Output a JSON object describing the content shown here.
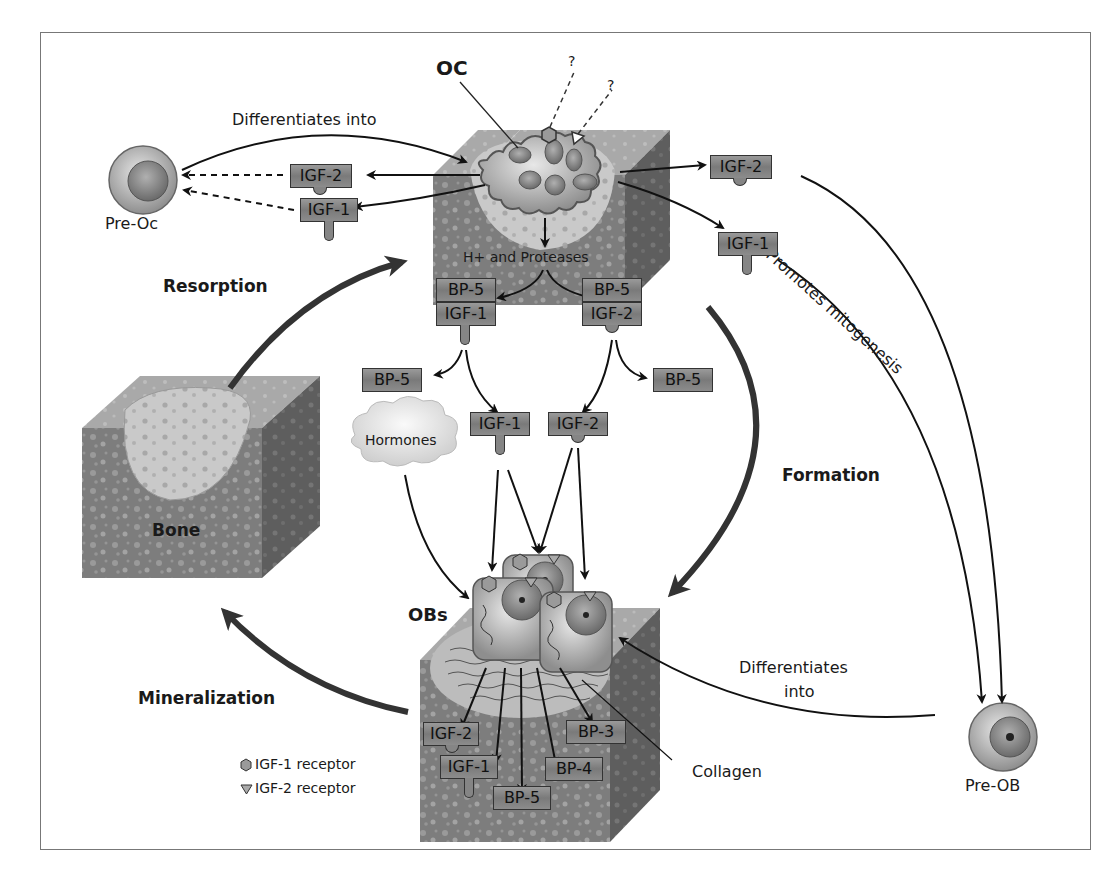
{
  "figure": {
    "title_labels": {
      "oc": "OC",
      "obs": "OBs",
      "bone": "Bone",
      "pre_oc": "Pre-Oc",
      "pre_ob": "Pre-OB",
      "hormones": "Hormones",
      "collagen": "Collagen",
      "h_proteases": "H+ and Proteases",
      "unknown_1": "?",
      "unknown_2": "?"
    },
    "processes": {
      "resorption": "Resorption",
      "formation": "Formation",
      "mineralization": "Mineralization",
      "differentiates_into_top": "Differentiates into",
      "differentiates_into_bottom_1": "Differentiates",
      "differentiates_into_bottom_2": "into",
      "promotes_mitogenesis": "Promotes mitogenesis"
    },
    "factors": {
      "oc_left_igf2": "IGF-2",
      "oc_left_igf1": "IGF-1",
      "oc_right_igf2": "IGF-2",
      "oc_right_igf1": "IGF-1",
      "matrix_bp5_left": "BP-5",
      "matrix_igf1_left": "IGF-1",
      "matrix_bp5_right": "BP-5",
      "matrix_igf2_right": "IGF-2",
      "released_bp5_left": "BP-5",
      "released_bp5_right": "BP-5",
      "free_igf1": "IGF-1",
      "free_igf2": "IGF-2",
      "ob_igf2": "IGF-2",
      "ob_igf1": "IGF-1",
      "ob_bp5": "BP-5",
      "ob_bp3": "BP-3",
      "ob_bp4": "BP-4"
    },
    "legend": [
      {
        "symbol": "hexagon",
        "label": "IGF-1 receptor"
      },
      {
        "symbol": "triangle",
        "label": "IGF-2 receptor"
      }
    ],
    "colors": {
      "bone_dark": "#7d7d7d",
      "bone_light": "#c4c4c4",
      "tag_fill": "#8a8a8a",
      "arrow": "#111111",
      "frame": "#777777"
    }
  }
}
